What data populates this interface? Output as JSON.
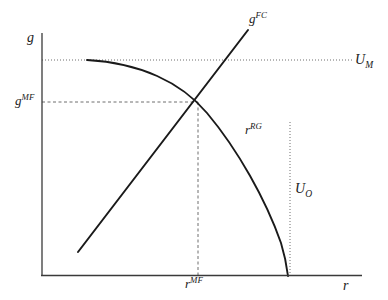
{
  "figure": {
    "type": "economics-line-diagram",
    "background_color": "#ffffff",
    "ink_color": "#1a1a1a",
    "guide_color": "#6e6e6e"
  },
  "axes": {
    "y_axis_label": "g",
    "x_axis_label": "r",
    "origin_px": {
      "x": 42,
      "y": 275
    },
    "y_axis_top_px": 33,
    "x_axis_right_px": 362
  },
  "curves": {
    "gfc": {
      "label_base": "g",
      "label_sup": "FC",
      "kind": "line",
      "description": "upward sloping straight line",
      "start_px": {
        "x": 78,
        "y": 252
      },
      "end_px": {
        "x": 248,
        "y": 30
      }
    },
    "rrg": {
      "label_base": "r",
      "label_sup": "RG",
      "kind": "concave-curve",
      "description": "downward sloping concave curve from flat top to x-axis",
      "start_px": {
        "x": 87,
        "y": 60
      },
      "end_px": {
        "x": 288,
        "y": 275
      }
    }
  },
  "guides": {
    "u_m": {
      "label_base": "U",
      "label_sub": "M",
      "style": "dotted",
      "orientation": "horizontal",
      "y_px": 60,
      "x_from_px": 42,
      "x_to_px": 352
    },
    "u_o": {
      "label_base": "U",
      "label_sub": "O",
      "style": "dotted",
      "orientation": "vertical",
      "x_px": 290,
      "y_from_px": 122,
      "y_to_px": 275
    },
    "g_mf": {
      "label_base": "g",
      "label_sup": "MF",
      "style": "dashed",
      "orientation": "horizontal",
      "y_px": 102,
      "x_from_px": 42,
      "x_to_px": 198
    },
    "r_mf": {
      "label_base": "r",
      "label_sup": "MF",
      "style": "dashed",
      "orientation": "vertical",
      "x_px": 198,
      "y_from_px": 102,
      "y_to_px": 275
    }
  },
  "equilibrium": {
    "name": "MF equilibrium intersection",
    "x_px": 198,
    "y_px": 102
  }
}
